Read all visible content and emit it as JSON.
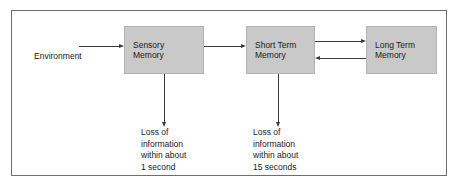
{
  "diagram": {
    "frame_border_color": "#6e6e6e",
    "box_fill_color": "#c9c9c9",
    "connector_color": "#3a3a3a",
    "background_color": "#ffffff",
    "source_label": "Environment",
    "boxes": [
      {
        "id": "sensory-memory",
        "line1": "Sensory",
        "line2": "Memory"
      },
      {
        "id": "short-term-memory",
        "line1": "Short Term",
        "line2": "Memory"
      },
      {
        "id": "long-term-memory",
        "line1": "Long Term",
        "line2": "Memory"
      }
    ],
    "loss_notes": [
      {
        "id": "loss-sensory",
        "line1": "Loss of",
        "line2": "information",
        "line3": "within about",
        "line4": "1 second"
      },
      {
        "id": "loss-short-term",
        "line1": "Loss of",
        "line2": "information",
        "line3": "within about",
        "line4": "15 seconds"
      }
    ],
    "connectors": [
      {
        "id": "environment-to-sensory",
        "direction": "right"
      },
      {
        "id": "sensory-to-short-term",
        "direction": "right"
      },
      {
        "id": "short-term-to-long-term",
        "direction": "right"
      },
      {
        "id": "long-term-to-short-term",
        "direction": "left"
      },
      {
        "id": "sensory-to-loss",
        "direction": "down"
      },
      {
        "id": "short-term-to-loss",
        "direction": "down"
      }
    ]
  }
}
